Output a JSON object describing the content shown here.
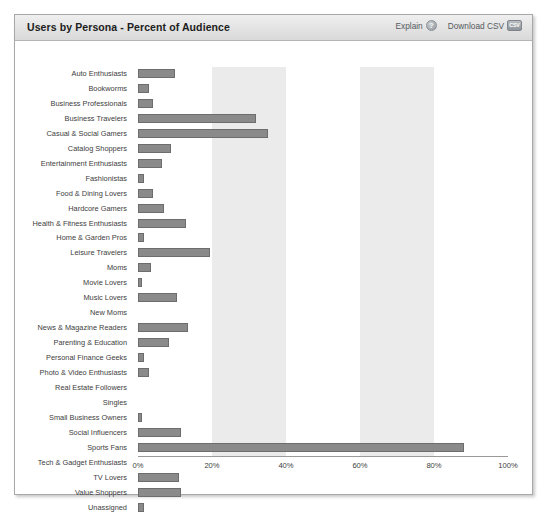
{
  "header": {
    "title": "Users by Persona - Percent of Audience",
    "actions": [
      {
        "label": "Explain",
        "icon": "help-circle-icon"
      },
      {
        "label": "Download CSV",
        "icon": "csv-file-icon"
      }
    ]
  },
  "colors": {
    "bar_fill": "#8a8a8a",
    "bar_stroke": "#6d6d6d",
    "band": "#ebebeb",
    "panel_header": "#e4e4e4",
    "panel_border": "#a8a8a8",
    "text": "#3d3d3d"
  },
  "chart_data": {
    "type": "bar",
    "orientation": "horizontal",
    "title": "Users by Persona - Percent of Audience",
    "xlabel": "",
    "ylabel": "",
    "xlim": [
      0,
      100
    ],
    "unit": "%",
    "grid": false,
    "legend": "none",
    "alternating_bands": [
      [
        20,
        40
      ],
      [
        60,
        80
      ]
    ],
    "xticks": [
      "0%",
      "20%",
      "40%",
      "60%",
      "80%",
      "100%"
    ],
    "xtick_values": [
      0,
      20,
      40,
      60,
      80,
      100
    ],
    "categories": [
      "Auto Enthusiasts",
      "Bookworms",
      "Business Professionals",
      "Business Travelers",
      "Casual & Social Gamers",
      "Catalog Shoppers",
      "Entertainment Enthusiasts",
      "Fashionistas",
      "Food & Dining Lovers",
      "Hardcore Gamers",
      "Health & Fitness Enthusiasts",
      "Home & Garden Pros",
      "Leisure Travelers",
      "Moms",
      "Movie Lovers",
      "Music Lovers",
      "New Moms",
      "News & Magazine Readers",
      "Parenting & Education",
      "Personal Finance Geeks",
      "Photo & Video Enthusiasts",
      "Real Estate Followers",
      "Singles",
      "Small Business Owners",
      "Social Influencers",
      "Sports Fans",
      "Tech & Gadget Enthusiasts",
      "TV Lovers",
      "Value Shoppers",
      "Unassigned"
    ],
    "values": [
      10,
      3,
      4,
      32,
      35,
      9,
      6.5,
      1.5,
      4,
      7,
      13,
      1.5,
      19.5,
      3.5,
      1,
      10.5,
      0,
      13.5,
      8.5,
      1.5,
      3,
      0,
      0,
      1,
      11.5,
      88,
      0,
      11,
      11.5,
      1.5
    ]
  }
}
